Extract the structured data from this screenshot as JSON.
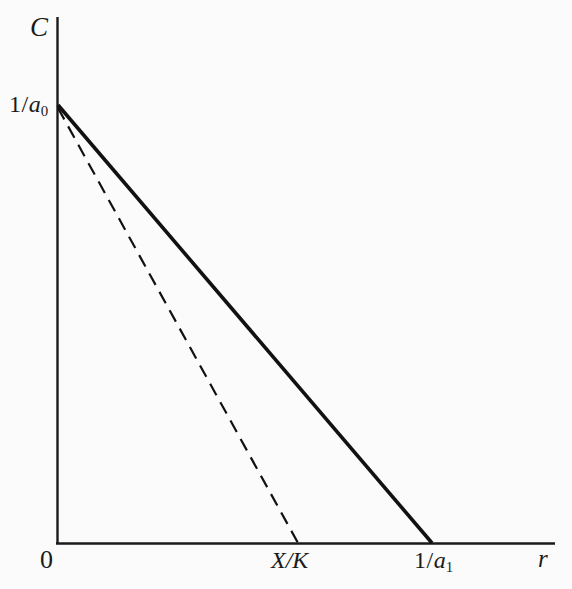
{
  "figure": {
    "background_color": "#fbfbfb",
    "ink_color": "#1a1a1a",
    "width": 572,
    "height": 589
  },
  "axes": {
    "y_axis_label": "C",
    "x_axis_label": "r",
    "origin_label": "0"
  },
  "labels": {
    "y_intercept": {
      "numerator": "1",
      "slash": "/",
      "variable": "a",
      "subscript": "0",
      "text": "1/a0"
    },
    "x_intercept_dashed": {
      "text": "X/K",
      "numerator": "X",
      "slash": "/",
      "denominator": "K"
    },
    "x_intercept_solid": {
      "numerator": "1",
      "slash": "/",
      "variable": "a",
      "subscript": "1",
      "text": "1/a1"
    }
  },
  "chart_data": {
    "type": "line",
    "title": "",
    "xlabel": "r",
    "ylabel": "C",
    "grid": false,
    "legend": "none",
    "xlim": [
      0,
      1.329
    ],
    "ylim": [
      0,
      1.168
    ],
    "x_tick_labels": [
      "0",
      "X/K",
      "1/a1",
      "r"
    ],
    "y_tick_labels": [
      "1/a0"
    ],
    "annotations": [
      "Solid line: C = 1/a0 at r = 0, falling to C = 0 at r = 1/a1",
      "Dashed line: C = 1/a0 at r = 0, falling to C = 0 at r = X/K",
      "X/K lies to the left of 1/a1 on the r axis"
    ],
    "series": [
      {
        "name": "solid-line",
        "style": "solid",
        "color": "#111111",
        "line_width_px": 3.6,
        "points_pixel": [
          [
            57,
            105
          ],
          [
            432,
            543
          ]
        ],
        "points_data": [
          [
            0,
            1.0
          ],
          [
            1.0,
            0
          ]
        ],
        "x_intercept_label": "1/a1",
        "y_intercept_label": "1/a0"
      },
      {
        "name": "dashed-line",
        "style": "dashed",
        "color": "#111111",
        "line_width_px": 2.2,
        "dash_pattern_px": [
          13,
          8
        ],
        "points_pixel": [
          [
            57,
            108
          ],
          [
            298,
            543
          ]
        ],
        "points_data": [
          [
            0,
            1.0
          ],
          [
            0.643,
            0
          ]
        ],
        "x_intercept_label": "X/K",
        "y_intercept_label": "1/a0"
      }
    ],
    "axis_geometry_pixel": {
      "y_axis": [
        [
          57,
          17
        ],
        [
          57,
          543
        ]
      ],
      "x_axis": [
        [
          57,
          543
        ],
        [
          555,
          543
        ]
      ]
    }
  }
}
